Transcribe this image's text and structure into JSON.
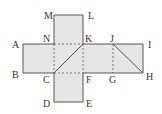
{
  "diagram": {
    "type": "geometric-net",
    "colors": {
      "fill": "#e6e6e6",
      "stroke": "#555555",
      "label": "#333333"
    },
    "points": {
      "M": [
        54,
        15
      ],
      "L": [
        83,
        15
      ],
      "A": [
        23,
        44
      ],
      "N": [
        54,
        44
      ],
      "K": [
        83,
        44
      ],
      "J": [
        113,
        44
      ],
      "I": [
        143,
        44
      ],
      "B": [
        23,
        73
      ],
      "C": [
        54,
        73
      ],
      "F": [
        83,
        73
      ],
      "G": [
        113,
        73
      ],
      "H": [
        143,
        73
      ],
      "D": [
        54,
        102
      ],
      "E": [
        83,
        102
      ]
    },
    "labels": [
      {
        "text": "M",
        "x": 44,
        "y": 19
      },
      {
        "text": "L",
        "x": 88,
        "y": 19
      },
      {
        "text": "A",
        "x": 12,
        "y": 48
      },
      {
        "text": "N",
        "x": 43,
        "y": 42
      },
      {
        "text": "K",
        "x": 85,
        "y": 42
      },
      {
        "text": "J",
        "x": 110,
        "y": 42
      },
      {
        "text": "I",
        "x": 148,
        "y": 48
      },
      {
        "text": "B",
        "x": 12,
        "y": 78
      },
      {
        "text": "C",
        "x": 43,
        "y": 83
      },
      {
        "text": "F",
        "x": 86,
        "y": 83
      },
      {
        "text": "G",
        "x": 109,
        "y": 83
      },
      {
        "text": "H",
        "x": 146,
        "y": 80
      },
      {
        "text": "D",
        "x": 43,
        "y": 107
      },
      {
        "text": "E",
        "x": 86,
        "y": 107
      }
    ]
  }
}
